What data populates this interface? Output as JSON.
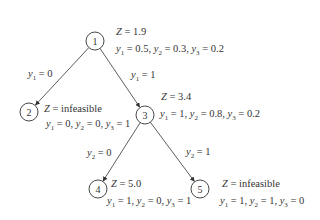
{
  "diagram": {
    "type": "branch-and-bound-tree",
    "nodes": [
      {
        "id": "1",
        "label": "1",
        "cx": 95,
        "cy": 41,
        "z": "Z = 1.9",
        "values": [
          {
            "v": "y",
            "s": "1",
            "eq": " = 0.5, "
          },
          {
            "v": "y",
            "s": "2",
            "eq": " = 0.3, "
          },
          {
            "v": "y",
            "s": "3",
            "eq": " = 0.2"
          }
        ],
        "zx": 116,
        "zy": 35,
        "vx": 116,
        "vy": 52
      },
      {
        "id": "2",
        "label": "2",
        "cx": 29,
        "cy": 112,
        "z": "Z = infeasible",
        "values": [
          {
            "v": "y",
            "s": "1",
            "eq": " = 0, "
          },
          {
            "v": "y",
            "s": "2",
            "eq": " = 0, "
          },
          {
            "v": "y",
            "s": "3",
            "eq": " = 1"
          }
        ],
        "zx": 44,
        "zy": 112,
        "vx": 46,
        "vy": 127
      },
      {
        "id": "3",
        "label": "3",
        "cx": 145,
        "cy": 115,
        "z": "Z = 3.4",
        "values": [
          {
            "v": "y",
            "s": "1",
            "eq": " = 1, "
          },
          {
            "v": "y",
            "s": "2",
            "eq": " = 0.8, "
          },
          {
            "v": "y",
            "s": "3",
            "eq": " = 0.2"
          }
        ],
        "zx": 161,
        "zy": 100,
        "vx": 160,
        "vy": 117
      },
      {
        "id": "4",
        "label": "4",
        "cx": 98,
        "cy": 189,
        "z": "Z = 5.0",
        "values": [
          {
            "v": "y",
            "s": "1",
            "eq": " = 1, "
          },
          {
            "v": "y",
            "s": "2",
            "eq": " = 0, "
          },
          {
            "v": "y",
            "s": "3",
            "eq": " = 1"
          }
        ],
        "zx": 111,
        "zy": 187,
        "vx": 107,
        "vy": 204
      },
      {
        "id": "5",
        "label": "5",
        "cx": 200,
        "cy": 189,
        "z": "Z = infeasible",
        "values": [
          {
            "v": "y",
            "s": "1",
            "eq": " = 1, "
          },
          {
            "v": "y",
            "s": "2",
            "eq": " = 1, "
          },
          {
            "v": "y",
            "s": "3",
            "eq": " = 0"
          }
        ],
        "zx": 222,
        "zy": 187,
        "vx": 220,
        "vy": 204
      }
    ],
    "edges": [
      {
        "from": "1",
        "to": "2",
        "branch_var": "y",
        "branch_sub": "1",
        "branch_eq": " = 0",
        "lx": 28,
        "ly": 77
      },
      {
        "from": "1",
        "to": "3",
        "branch_var": "y",
        "branch_sub": "1",
        "branch_eq": " = 1",
        "lx": 131,
        "ly": 78
      },
      {
        "from": "3",
        "to": "4",
        "branch_var": "y",
        "branch_sub": "2",
        "branch_eq": " = 0",
        "lx": 87,
        "ly": 156
      },
      {
        "from": "3",
        "to": "5",
        "branch_var": "y",
        "branch_sub": "2",
        "branch_eq": " = 1",
        "lx": 186,
        "ly": 155
      }
    ],
    "colors": {
      "stroke": "#333333",
      "text": "#333333",
      "background": "#ffffff"
    }
  }
}
